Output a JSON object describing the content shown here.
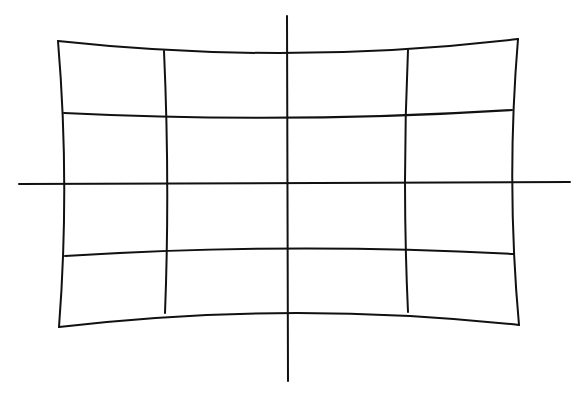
{
  "diagram": {
    "title": "",
    "stroke_color": "#111111",
    "background": "#ffffff",
    "stroke_width": 2,
    "axes": {
      "horizontal": {
        "x1": 19,
        "y1": 184,
        "x2": 570,
        "y2": 182
      },
      "vertical": {
        "x1": 287,
        "y1": 16,
        "x2": 288,
        "y2": 381
      }
    },
    "curves": [
      {
        "name": "top-edge",
        "d": "M58,41 Q288,66 518,39"
      },
      {
        "name": "row-line-upper",
        "d": "M64,113 Q288,124 512,110"
      },
      {
        "name": "row-line-lower",
        "d": "M65,256 Q288,242 514,254"
      },
      {
        "name": "bottom-edge",
        "d": "M59,327 Q288,300 519,325"
      },
      {
        "name": "left-edge",
        "d": "M58,41 Q70,184 59,327"
      },
      {
        "name": "right-edge",
        "d": "M518,39 Q506,182 519,325"
      },
      {
        "name": "inner-vertical-left",
        "d": "M164,51 Q170,184 165,313"
      },
      {
        "name": "inner-vertical-right",
        "d": "M408,50 Q402,182 408,312"
      }
    ]
  }
}
